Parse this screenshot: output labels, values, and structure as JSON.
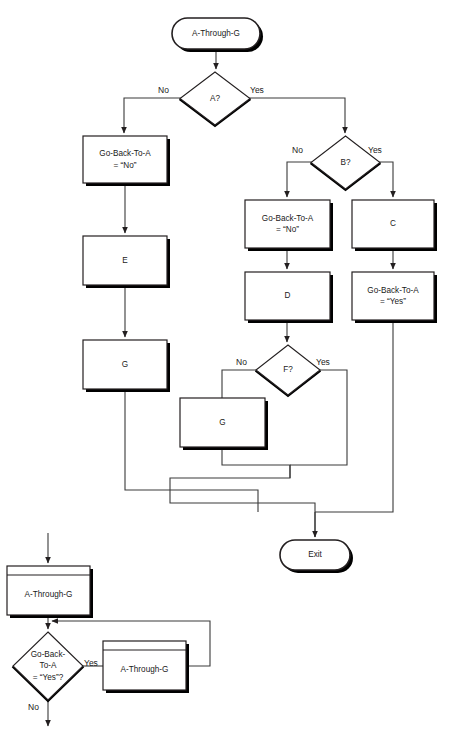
{
  "diagram": {
    "colors": {
      "stroke": "#231f20",
      "shadow": "#000000",
      "fill": "#ffffff",
      "text": "#1a1a1a"
    },
    "nodes": [
      {
        "id": "start",
        "type": "terminator",
        "label": "A-Through-G",
        "x": 172,
        "y": 18,
        "w": 88,
        "h": 31
      },
      {
        "id": "dec-a",
        "type": "decision",
        "label": "A?",
        "x": 180,
        "y": 72,
        "w": 70,
        "h": 53
      },
      {
        "id": "gba-no-left",
        "type": "process",
        "label": "Go-Back-To-A\n= “No”",
        "x": 83,
        "y": 136,
        "w": 84,
        "h": 47
      },
      {
        "id": "box-e",
        "type": "process",
        "label": "E",
        "x": 83,
        "y": 236,
        "w": 84,
        "h": 49
      },
      {
        "id": "box-g-left",
        "type": "process",
        "label": "G",
        "x": 83,
        "y": 340,
        "w": 84,
        "h": 49
      },
      {
        "id": "dec-b",
        "type": "decision",
        "label": "B?",
        "x": 311,
        "y": 136,
        "w": 69,
        "h": 53
      },
      {
        "id": "gba-no-mid",
        "type": "process",
        "label": "Go-Back-To-A\n= “No”",
        "x": 245,
        "y": 200,
        "w": 85,
        "h": 48
      },
      {
        "id": "box-d",
        "type": "process",
        "label": "D",
        "x": 245,
        "y": 272,
        "w": 85,
        "h": 48
      },
      {
        "id": "box-c",
        "type": "process",
        "label": "C",
        "x": 352,
        "y": 200,
        "w": 82,
        "h": 48
      },
      {
        "id": "gba-yes",
        "type": "process",
        "label": "Go-Back-To-A\n= “Yes”",
        "x": 352,
        "y": 272,
        "w": 82,
        "h": 48
      },
      {
        "id": "dec-f",
        "type": "decision",
        "label": "F?",
        "x": 256,
        "y": 345,
        "w": 64,
        "h": 50
      },
      {
        "id": "box-g-mid",
        "type": "process",
        "label": "G",
        "x": 180,
        "y": 398,
        "w": 85,
        "h": 49
      },
      {
        "id": "exit",
        "type": "terminator",
        "label": "Exit",
        "x": 280,
        "y": 540,
        "w": 70,
        "h": 30
      },
      {
        "id": "sub-atg-1",
        "type": "predefined-process",
        "label": "A-Through-G",
        "x": 7,
        "y": 566,
        "w": 83,
        "h": 49
      },
      {
        "id": "dec-goback",
        "type": "decision",
        "label": "Go-Back-\nTo-A\n= “Yes”?",
        "x": 13,
        "y": 632,
        "w": 70,
        "h": 68
      },
      {
        "id": "sub-atg-2",
        "type": "predefined-process",
        "label": "A-Through-G",
        "x": 103,
        "y": 641,
        "w": 83,
        "h": 49
      }
    ],
    "edge_labels": [
      {
        "id": "a-no",
        "text": "No",
        "x": 158,
        "y": 85
      },
      {
        "id": "a-yes",
        "text": "Yes",
        "x": 250,
        "y": 85
      },
      {
        "id": "b-no",
        "text": "No",
        "x": 292,
        "y": 145
      },
      {
        "id": "b-yes",
        "text": "Yes",
        "x": 368,
        "y": 145
      },
      {
        "id": "f-no",
        "text": "No",
        "x": 236,
        "y": 357
      },
      {
        "id": "f-yes",
        "text": "Yes",
        "x": 316,
        "y": 357
      },
      {
        "id": "goback-yes",
        "text": "Yes",
        "x": 84,
        "y": 658
      },
      {
        "id": "goback-no",
        "text": "No",
        "x": 28,
        "y": 702
      }
    ]
  }
}
